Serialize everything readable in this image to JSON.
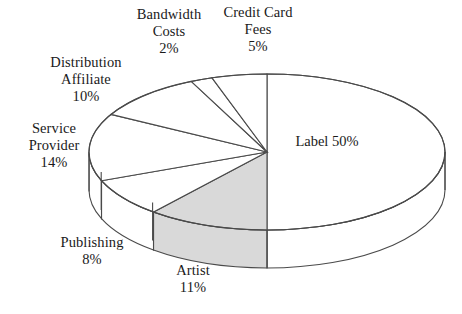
{
  "chart_data": {
    "type": "pie",
    "title": "",
    "subtitle": "",
    "xlabel": "",
    "ylabel": "",
    "grid": false,
    "legend_position": "none",
    "style": "3d-exploded-none",
    "start_angle_deg": 90,
    "direction": "clockwise",
    "unit": "%",
    "categories": [
      "Label",
      "Artist",
      "Publishing",
      "Service Provider",
      "Distribution Affiliate",
      "Bandwidth Costs",
      "Credit Card Fees"
    ],
    "values": [
      50,
      11,
      8,
      14,
      10,
      2,
      5
    ],
    "slices": [
      {
        "name": "Label",
        "value": 50,
        "pct_text": "50%",
        "fill": "#ffffff",
        "label_placement": "inside"
      },
      {
        "name": "Artist",
        "value": 11,
        "pct_text": "11%",
        "fill": "#d9d9d9",
        "label_placement": "outside"
      },
      {
        "name": "Publishing",
        "value": 8,
        "pct_text": "8%",
        "fill": "#ffffff",
        "label_placement": "outside"
      },
      {
        "name": "Service Provider",
        "value": 14,
        "pct_text": "14%",
        "fill": "#ffffff",
        "label_placement": "outside"
      },
      {
        "name": "Distribution Affiliate",
        "value": 10,
        "pct_text": "10%",
        "fill": "#ffffff",
        "label_placement": "outside"
      },
      {
        "name": "Bandwidth Costs",
        "value": 2,
        "pct_text": "2%",
        "fill": "#ffffff",
        "label_placement": "outside"
      },
      {
        "name": "Credit Card Fees",
        "value": 5,
        "pct_text": "5%",
        "fill": "#ffffff",
        "label_placement": "outside"
      }
    ],
    "colors": {
      "outline": "#4a4a4a",
      "highlight_fill": "#d9d9d9",
      "plain_fill": "#ffffff",
      "background": "#ffffff",
      "text": "#1a1a1a"
    }
  },
  "labels": {
    "label": {
      "line1": "Label",
      "line2": "",
      "pct": "50%"
    },
    "artist": {
      "line1": "Artist",
      "line2": "",
      "pct": "11%"
    },
    "publishing": {
      "line1": "Publishing",
      "line2": "",
      "pct": "8%"
    },
    "service": {
      "line1": "Service",
      "line2": "Provider",
      "pct": "14%"
    },
    "distribution": {
      "line1": "Distribution",
      "line2": "Affiliate",
      "pct": "10%"
    },
    "bandwidth": {
      "line1": "Bandwidth",
      "line2": "Costs",
      "pct": "2%"
    },
    "creditcard": {
      "line1": "Credit Card",
      "line2": "Fees",
      "pct": "5%"
    }
  }
}
